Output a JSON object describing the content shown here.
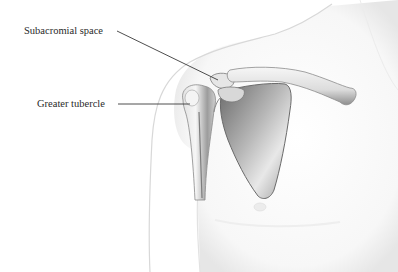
{
  "diagram": {
    "type": "anatomical-illustration",
    "labels": [
      {
        "id": "subacromial-space",
        "text": "Subacromial space"
      },
      {
        "id": "greater-tubercle",
        "text": "Greater tubercle"
      }
    ]
  },
  "colors": {
    "background": "#ffffff",
    "label_text": "#2a2a2a",
    "leader_line": "#3a3a3a",
    "skin_outline": "#d6d6d6",
    "bone_light": "#f2f2f2",
    "bone_mid": "#bdbdbd",
    "bone_dark": "#6e6e6e"
  }
}
